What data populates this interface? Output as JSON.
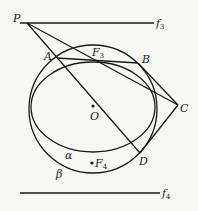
{
  "diagram": {
    "type": "geometry",
    "colors": {
      "stroke": "#1a1a1a",
      "background": "#f7f7f5"
    },
    "points": {
      "P": {
        "label": "P",
        "x": 27,
        "y": 23
      },
      "A": {
        "label": "A",
        "x": 57,
        "y": 58
      },
      "B": {
        "label": "B",
        "x": 138,
        "y": 63
      },
      "C": {
        "label": "C",
        "x": 178,
        "y": 105
      },
      "D": {
        "label": "D",
        "x": 140,
        "y": 153
      },
      "F3": {
        "label": "F",
        "sub": "3",
        "x": 96,
        "y": 61
      },
      "O": {
        "label": "O",
        "x": 93,
        "y": 106
      },
      "F4": {
        "label": "F",
        "sub": "4",
        "x": 92,
        "y": 163
      }
    },
    "lines": {
      "f3": {
        "label": "f",
        "sub": "3",
        "x1": 20,
        "y1": 23,
        "x2": 154,
        "y2": 23
      },
      "f4": {
        "label": "f",
        "sub": "4",
        "x1": 20,
        "y1": 193,
        "x2": 160,
        "y2": 193
      }
    },
    "curves": {
      "alpha": {
        "label": "α",
        "cx": 93,
        "cy": 107,
        "rx": 62,
        "ry": 45
      },
      "beta": {
        "label": "β",
        "cx": 93,
        "cy": 109,
        "r": 64
      }
    },
    "segments": [
      "PA",
      "AD",
      "PC",
      "AB",
      "BC",
      "CD"
    ]
  }
}
